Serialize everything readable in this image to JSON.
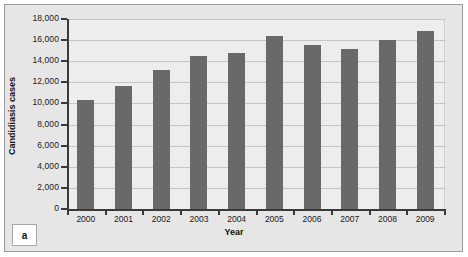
{
  "panel": {
    "letter": "a"
  },
  "chart_data": {
    "type": "bar",
    "title": "",
    "xlabel": "Year",
    "ylabel": "Candidiasis cases",
    "categories": [
      "2000",
      "2001",
      "2002",
      "2003",
      "2004",
      "2005",
      "2006",
      "2007",
      "2008",
      "2009"
    ],
    "values": [
      10300,
      11700,
      13200,
      14500,
      14800,
      16400,
      15500,
      15200,
      16000,
      16900
    ],
    "ylim": [
      0,
      18000
    ],
    "ytick_values": [
      0,
      2000,
      4000,
      6000,
      8000,
      10000,
      12000,
      14000,
      16000,
      18000
    ],
    "ytick_labels": [
      "0",
      "2,000",
      "4,000",
      "6,000",
      "8,000",
      "10,000",
      "12,000",
      "14,000",
      "16,000",
      "18,000"
    ],
    "grid": true,
    "grid_axis": "y",
    "legend": null,
    "bar_color": "#696969",
    "plot_background": "#ededed",
    "panel_background": "#e6e6e6",
    "axis_color": "#3a3a3a",
    "gridline_color": "#c5c5c5"
  }
}
